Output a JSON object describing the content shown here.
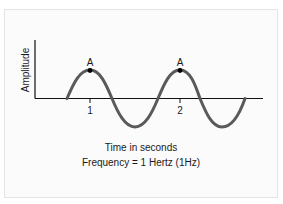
{
  "diagram": {
    "type": "sine-wave",
    "y_axis_label": "Amplitude",
    "x_axis_caption": "Time in seconds",
    "subcaption": "Frequency = 1 Hertz (1Hz)",
    "ticks": [
      {
        "label": "1"
      },
      {
        "label": "2"
      }
    ],
    "peaks": [
      {
        "label": "A"
      },
      {
        "label": "A"
      }
    ],
    "colors": {
      "wave": "#5a5a5a",
      "axis": "#111111",
      "text": "#1a1a1a",
      "background": "#fbfbfb",
      "border": "#e4e4e4"
    }
  }
}
